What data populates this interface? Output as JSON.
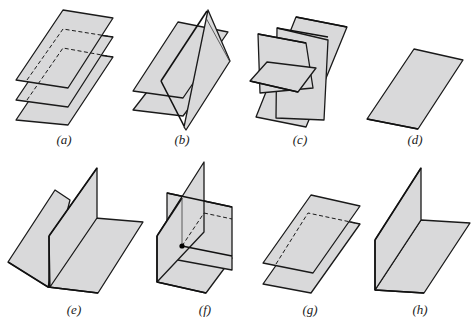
{
  "figure": {
    "panels": [
      {
        "id": "a",
        "label": "(a)",
        "caption": "three parallel planes"
      },
      {
        "id": "b",
        "label": "(b)",
        "caption": "two parallel planes cut by a third plane"
      },
      {
        "id": "c",
        "label": "(c)",
        "caption": "three planes intersecting pairwise in three parallel lines"
      },
      {
        "id": "d",
        "label": "(d)",
        "caption": "three coincident planes"
      },
      {
        "id": "e",
        "label": "(e)",
        "caption": "three planes intersecting in a common line"
      },
      {
        "id": "f",
        "label": "(f)",
        "caption": "three planes intersecting in a single point"
      },
      {
        "id": "g",
        "label": "(g)",
        "caption": "two coincident planes parallel to a third"
      },
      {
        "id": "h",
        "label": "(h)",
        "caption": "two coincident planes intersecting a third"
      }
    ],
    "colors": {
      "plane_fill": "#d9d9da",
      "stroke": "#1a1a1a",
      "background": "#ffffff"
    }
  }
}
